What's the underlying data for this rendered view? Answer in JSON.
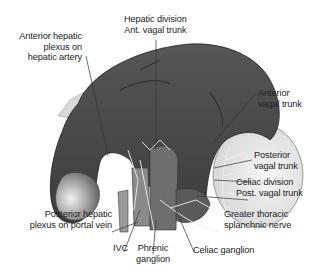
{
  "diagram": {
    "type": "anatomical-illustration",
    "labels": {
      "hepatic_division": [
        "Hepatic division",
        "Ant. vagal trunk"
      ],
      "anterior_hepatic_plexus": [
        "Anterior hepatic",
        "plexus on",
        "hepatic artery"
      ],
      "anterior_vagal_trunk": [
        "Anterior",
        "vagal trunk"
      ],
      "posterior_vagal_trunk": [
        "Posterior",
        "vagal trunk"
      ],
      "celiac_division": [
        "Celiac division",
        "Post. vagal trunk"
      ],
      "greater_thoracic_splanchnic": [
        "Greater thoracic",
        "splanchnic nerve"
      ],
      "posterior_hepatic_plexus": [
        "Posterior hepatic",
        "plexus on portal vein"
      ],
      "ivc": [
        "IVC"
      ],
      "phrenic_ganglion": [
        "Phrenic",
        "ganglion"
      ],
      "celiac_ganglion": [
        "Celiac ganglion"
      ]
    },
    "colors": {
      "liver_dark": "#4a4a4a",
      "liver_mid": "#6a6a6a",
      "gallbladder": "#9a9a9a",
      "stomach_light": "#e6e6e6",
      "nerve": "#f0f0f0",
      "leader_line": "#333333"
    }
  }
}
